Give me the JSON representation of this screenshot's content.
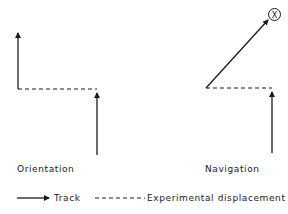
{
  "panels": [
    {
      "id": "orientation",
      "label": "Orientation"
    },
    {
      "id": "navigation",
      "label": "Navigation"
    }
  ],
  "goal_marker": {
    "symbol": "X"
  },
  "legend": {
    "track_label": "Track",
    "displacement_label": "Experimental displacement"
  },
  "colors": {
    "ink": "#1a1a1a",
    "background": "#ffffff"
  }
}
